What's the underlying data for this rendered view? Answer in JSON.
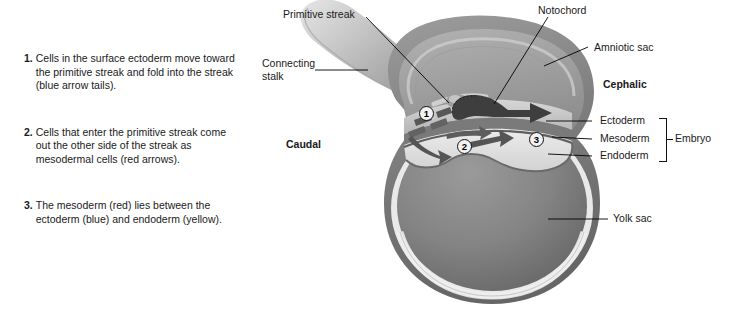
{
  "figure": {
    "background_color": "#ffffff",
    "art_palette": {
      "outer_membrane_dark": "#6e6e6e",
      "amnion_mid": "#8a8a8a",
      "cavity_light": "#c9c9c9",
      "disc_pale": "#e3e3e3",
      "yolk_sac_fill": "#787878",
      "yolk_rim_light": "#e8e8e8",
      "arrow_dark": "#3a3a3a",
      "stalk_light": "#b9b9b9",
      "leader_line": "#000000"
    }
  },
  "captions": [
    {
      "number": "1.",
      "text": "Cells in the surface ectoderm move toward the primitive streak and fold into the streak (blue arrow tails)."
    },
    {
      "number": "2.",
      "text": "Cells that enter the primitive streak come out the other side of the streak as mesodermal cells (red arrows)."
    },
    {
      "number": "3.",
      "text": "The mesoderm (red) lies between the ectoderm (blue) and endoderm (yellow)."
    }
  ],
  "labels": {
    "primitive_streak": "Primitive streak",
    "connecting_stalk": "Connecting stalk",
    "caudal": "Caudal",
    "notochord": "Notochord",
    "amniotic_sac": "Amniotic sac",
    "cephalic": "Cephalic",
    "ectoderm": "Ectoderm",
    "mesoderm": "Mesoderm",
    "endoderm": "Endoderm",
    "embryo": "Embryo",
    "yolk_sac": "Yolk sac"
  },
  "markers": [
    {
      "id": "1",
      "label": "1"
    },
    {
      "id": "2",
      "label": "2"
    },
    {
      "id": "3",
      "label": "3"
    }
  ]
}
